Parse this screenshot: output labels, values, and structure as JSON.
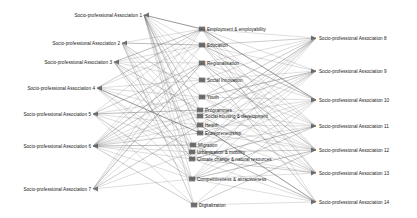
{
  "figure": {
    "type": "network-diagram",
    "title": "",
    "background": "#ffffff",
    "edge_color": "#6e6e6e",
    "node_color": "#5a5a5a",
    "text_color": "#161616"
  },
  "chart_data": {
    "type": "network",
    "title": "",
    "columns": [
      {
        "id": "left",
        "position": "left",
        "nodes": [
          {
            "id": "L1",
            "label": "Socio-professional Association 1",
            "x": 144,
            "y": 15
          },
          {
            "id": "L2",
            "label": "Socio-professional Association 2",
            "x": 122,
            "y": 43
          },
          {
            "id": "L3",
            "label": "Socio-professional Association 3",
            "x": 114,
            "y": 62
          },
          {
            "id": "L4",
            "label": "Socio-professional Association 4",
            "x": 97,
            "y": 88
          },
          {
            "id": "L5",
            "label": "Socio-professional Association 5",
            "x": 93,
            "y": 114
          },
          {
            "id": "L6",
            "label": "Socio-professional Association 6",
            "x": 93,
            "y": 146
          },
          {
            "id": "L7",
            "label": "Socio-professional Association 7",
            "x": 93,
            "y": 189
          }
        ]
      },
      {
        "id": "middle",
        "position": "center",
        "nodes": [
          {
            "id": "M1",
            "label": "Employment & employability",
            "x": 202,
            "y": 29
          },
          {
            "id": "M2",
            "label": "Education",
            "x": 202,
            "y": 45
          },
          {
            "id": "M3",
            "label": "Regionalisation",
            "x": 202,
            "y": 63
          },
          {
            "id": "M4",
            "label": "Social innovation",
            "x": 202,
            "y": 80
          },
          {
            "id": "M5",
            "label": "Youth",
            "x": 202,
            "y": 97
          },
          {
            "id": "M6",
            "label": "Programmes",
            "x": 200,
            "y": 110
          },
          {
            "id": "M7",
            "label": "Social housing & development",
            "x": 200,
            "y": 116
          },
          {
            "id": "M8",
            "label": "Health",
            "x": 200,
            "y": 125
          },
          {
            "id": "M9",
            "label": "Entrepreneurship",
            "x": 200,
            "y": 133
          },
          {
            "id": "M10",
            "label": "Migration",
            "x": 193,
            "y": 145
          },
          {
            "id": "M11",
            "label": "Urbanisation & mobility",
            "x": 192,
            "y": 152
          },
          {
            "id": "M12",
            "label": "Climate change & natural resources",
            "x": 192,
            "y": 159
          },
          {
            "id": "M13",
            "label": "Competitiveness & attractiveness",
            "x": 192,
            "y": 179
          },
          {
            "id": "M14",
            "label": "Digitalization",
            "x": 194,
            "y": 205
          }
        ]
      },
      {
        "id": "right",
        "position": "right",
        "nodes": [
          {
            "id": "R1",
            "label": "Socio-professional Association 8",
            "x": 316,
            "y": 38
          },
          {
            "id": "R2",
            "label": "Socio-professional Association 9",
            "x": 316,
            "y": 71
          },
          {
            "id": "R3",
            "label": "Socio-professional Association 10",
            "x": 316,
            "y": 100
          },
          {
            "id": "R4",
            "label": "Socio-professional Association 11",
            "x": 316,
            "y": 126
          },
          {
            "id": "R5",
            "label": "Socio-professional Association 12",
            "x": 316,
            "y": 150
          },
          {
            "id": "R6",
            "label": "Socio-professional Association 13",
            "x": 316,
            "y": 173
          },
          {
            "id": "R7",
            "label": "Socio-professional Association 14",
            "x": 316,
            "y": 202
          }
        ]
      }
    ],
    "edges": [
      {
        "from": "L1",
        "to": "M1"
      },
      {
        "from": "L1",
        "to": "M2"
      },
      {
        "from": "L1",
        "to": "M3"
      },
      {
        "from": "L1",
        "to": "M4"
      },
      {
        "from": "L1",
        "to": "M5"
      },
      {
        "from": "L1",
        "to": "M6"
      },
      {
        "from": "L1",
        "to": "M8"
      },
      {
        "from": "L1",
        "to": "M9"
      },
      {
        "from": "L1",
        "to": "M10"
      },
      {
        "from": "L1",
        "to": "M11"
      },
      {
        "from": "L1",
        "to": "M12"
      },
      {
        "from": "L1",
        "to": "M13"
      },
      {
        "from": "L1",
        "to": "M14"
      },
      {
        "from": "L2",
        "to": "M1"
      },
      {
        "from": "L2",
        "to": "M2"
      },
      {
        "from": "L2",
        "to": "M5"
      },
      {
        "from": "L2",
        "to": "M7"
      },
      {
        "from": "L2",
        "to": "M9"
      },
      {
        "from": "L2",
        "to": "M11"
      },
      {
        "from": "L2",
        "to": "M13"
      },
      {
        "from": "L2",
        "to": "M14"
      },
      {
        "from": "L3",
        "to": "M1"
      },
      {
        "from": "L3",
        "to": "M2"
      },
      {
        "from": "L3",
        "to": "M3"
      },
      {
        "from": "L3",
        "to": "M4"
      },
      {
        "from": "L3",
        "to": "M6"
      },
      {
        "from": "L3",
        "to": "M8"
      },
      {
        "from": "L3",
        "to": "M10"
      },
      {
        "from": "L3",
        "to": "M12"
      },
      {
        "from": "L3",
        "to": "M13"
      },
      {
        "from": "L4",
        "to": "M1"
      },
      {
        "from": "L4",
        "to": "M2"
      },
      {
        "from": "L4",
        "to": "M4"
      },
      {
        "from": "L4",
        "to": "M5"
      },
      {
        "from": "L4",
        "to": "M7"
      },
      {
        "from": "L4",
        "to": "M9"
      },
      {
        "from": "L4",
        "to": "M11"
      },
      {
        "from": "L4",
        "to": "M12"
      },
      {
        "from": "L4",
        "to": "M13"
      },
      {
        "from": "L5",
        "to": "M1"
      },
      {
        "from": "L5",
        "to": "M3"
      },
      {
        "from": "L5",
        "to": "M5"
      },
      {
        "from": "L5",
        "to": "M6"
      },
      {
        "from": "L5",
        "to": "M8"
      },
      {
        "from": "L5",
        "to": "M10"
      },
      {
        "from": "L5",
        "to": "M13"
      },
      {
        "from": "L5",
        "to": "M14"
      },
      {
        "from": "L6",
        "to": "M1"
      },
      {
        "from": "L6",
        "to": "M2"
      },
      {
        "from": "L6",
        "to": "M3"
      },
      {
        "from": "L6",
        "to": "M4"
      },
      {
        "from": "L6",
        "to": "M5"
      },
      {
        "from": "L6",
        "to": "M6"
      },
      {
        "from": "L6",
        "to": "M7"
      },
      {
        "from": "L6",
        "to": "M8"
      },
      {
        "from": "L6",
        "to": "M9"
      },
      {
        "from": "L6",
        "to": "M10"
      },
      {
        "from": "L6",
        "to": "M11"
      },
      {
        "from": "L6",
        "to": "M12"
      },
      {
        "from": "L6",
        "to": "M13"
      },
      {
        "from": "L6",
        "to": "M14"
      },
      {
        "from": "L7",
        "to": "M1"
      },
      {
        "from": "L7",
        "to": "M2"
      },
      {
        "from": "L7",
        "to": "M3"
      },
      {
        "from": "L7",
        "to": "M5"
      },
      {
        "from": "L7",
        "to": "M8"
      },
      {
        "from": "L7",
        "to": "M11"
      },
      {
        "from": "L7",
        "to": "M13"
      },
      {
        "from": "M1",
        "to": "R1"
      },
      {
        "from": "M1",
        "to": "R2"
      },
      {
        "from": "M1",
        "to": "R3"
      },
      {
        "from": "M1",
        "to": "R4"
      },
      {
        "from": "M1",
        "to": "R5"
      },
      {
        "from": "M1",
        "to": "R6"
      },
      {
        "from": "M1",
        "to": "R7"
      },
      {
        "from": "M2",
        "to": "R1"
      },
      {
        "from": "M2",
        "to": "R2"
      },
      {
        "from": "M2",
        "to": "R3"
      },
      {
        "from": "M2",
        "to": "R4"
      },
      {
        "from": "M2",
        "to": "R5"
      },
      {
        "from": "M2",
        "to": "R6"
      },
      {
        "from": "M3",
        "to": "R1"
      },
      {
        "from": "M3",
        "to": "R3"
      },
      {
        "from": "M3",
        "to": "R4"
      },
      {
        "from": "M3",
        "to": "R5"
      },
      {
        "from": "M3",
        "to": "R7"
      },
      {
        "from": "M4",
        "to": "R1"
      },
      {
        "from": "M4",
        "to": "R2"
      },
      {
        "from": "M4",
        "to": "R4"
      },
      {
        "from": "M4",
        "to": "R6"
      },
      {
        "from": "M5",
        "to": "R1"
      },
      {
        "from": "M5",
        "to": "R2"
      },
      {
        "from": "M5",
        "to": "R3"
      },
      {
        "from": "M5",
        "to": "R5"
      },
      {
        "from": "M5",
        "to": "R6"
      },
      {
        "from": "M6",
        "to": "R2"
      },
      {
        "from": "M6",
        "to": "R4"
      },
      {
        "from": "M6",
        "to": "R5"
      },
      {
        "from": "M7",
        "to": "R1"
      },
      {
        "from": "M7",
        "to": "R3"
      },
      {
        "from": "M7",
        "to": "R6"
      },
      {
        "from": "M8",
        "to": "R1"
      },
      {
        "from": "M8",
        "to": "R2"
      },
      {
        "from": "M8",
        "to": "R4"
      },
      {
        "from": "M8",
        "to": "R5"
      },
      {
        "from": "M8",
        "to": "R7"
      },
      {
        "from": "M9",
        "to": "R1"
      },
      {
        "from": "M9",
        "to": "R3"
      },
      {
        "from": "M9",
        "to": "R5"
      },
      {
        "from": "M9",
        "to": "R6"
      },
      {
        "from": "M10",
        "to": "R2"
      },
      {
        "from": "M10",
        "to": "R4"
      },
      {
        "from": "M10",
        "to": "R7"
      },
      {
        "from": "M11",
        "to": "R1"
      },
      {
        "from": "M11",
        "to": "R3"
      },
      {
        "from": "M11",
        "to": "R5"
      },
      {
        "from": "M11",
        "to": "R6"
      },
      {
        "from": "M12",
        "to": "R1"
      },
      {
        "from": "M12",
        "to": "R2"
      },
      {
        "from": "M12",
        "to": "R4"
      },
      {
        "from": "M12",
        "to": "R6"
      },
      {
        "from": "M12",
        "to": "R7"
      },
      {
        "from": "M13",
        "to": "R1"
      },
      {
        "from": "M13",
        "to": "R2"
      },
      {
        "from": "M13",
        "to": "R3"
      },
      {
        "from": "M13",
        "to": "R4"
      },
      {
        "from": "M13",
        "to": "R5"
      },
      {
        "from": "M13",
        "to": "R6"
      },
      {
        "from": "M13",
        "to": "R7"
      },
      {
        "from": "M14",
        "to": "R3"
      },
      {
        "from": "M14",
        "to": "R5"
      },
      {
        "from": "M14",
        "to": "R7"
      }
    ]
  }
}
